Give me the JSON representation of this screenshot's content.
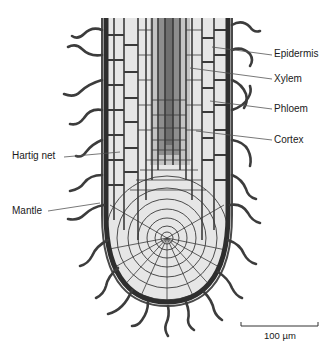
{
  "figure": {
    "labels": {
      "epidermis": "Epidermis",
      "xylem": "Xylem",
      "phloem": "Phloem",
      "cortex": "Cortex",
      "hartig_net": "Hartig net",
      "mantle": "Mantle"
    },
    "scale_bar": {
      "label": "100 µm"
    },
    "colors": {
      "cell_fill": "#e6e6e6",
      "cell_wall": "#3a3a3a",
      "xylem_fill": "#8a8a8a",
      "phloem_fill": "#bdbdbd",
      "hyphae": "#3c3c3c",
      "leader_line": "#555555"
    }
  }
}
